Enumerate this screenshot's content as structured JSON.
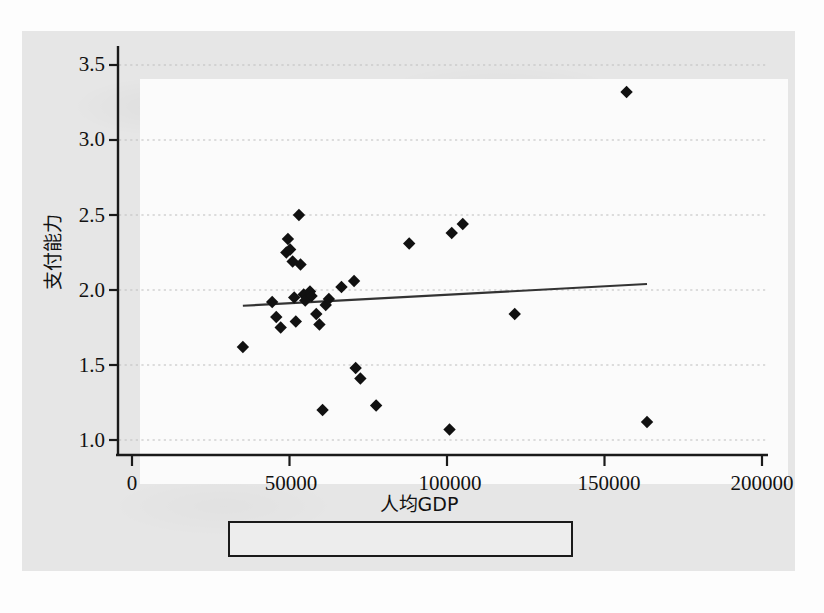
{
  "chart_data": {
    "type": "scatter",
    "title": "",
    "xlabel": "人均GDP",
    "ylabel": "支付能力",
    "xlim": [
      0,
      200000
    ],
    "ylim": [
      0.88,
      3.62
    ],
    "x_ticks": [
      0,
      50000,
      100000,
      150000,
      200000
    ],
    "x_tick_labels": [
      "0",
      "50000",
      "100000",
      "150000",
      "200000"
    ],
    "y_ticks": [
      1.0,
      1.5,
      2.0,
      2.5,
      3.0,
      3.5
    ],
    "y_tick_labels": [
      "1.0",
      "1.5",
      "2.0",
      "2.5",
      "3.0",
      "3.5"
    ],
    "grid": "horizontal-dotted",
    "legend_position": "bottom-center",
    "series": [
      {
        "name": "rate_m",
        "type": "scatter",
        "marker": "diamond",
        "color": "#111111",
        "points": [
          [
            35200,
            1.62
          ],
          [
            44500,
            1.92
          ],
          [
            45800,
            1.82
          ],
          [
            47200,
            1.75
          ],
          [
            49000,
            2.25
          ],
          [
            49500,
            2.34
          ],
          [
            50200,
            2.27
          ],
          [
            51000,
            2.19
          ],
          [
            51500,
            1.95
          ],
          [
            52000,
            1.79
          ],
          [
            53000,
            2.5
          ],
          [
            53500,
            2.17
          ],
          [
            54500,
            1.97
          ],
          [
            55000,
            1.93
          ],
          [
            56500,
            1.99
          ],
          [
            57000,
            1.96
          ],
          [
            58500,
            1.84
          ],
          [
            59500,
            1.77
          ],
          [
            60500,
            1.2
          ],
          [
            61500,
            1.9
          ],
          [
            62500,
            1.94
          ],
          [
            66500,
            2.02
          ],
          [
            70500,
            2.06
          ],
          [
            71000,
            1.48
          ],
          [
            72500,
            1.41
          ],
          [
            77500,
            1.23
          ],
          [
            88000,
            2.31
          ],
          [
            100800,
            1.07
          ],
          [
            101500,
            2.38
          ],
          [
            105000,
            2.44
          ],
          [
            121500,
            1.84
          ],
          [
            157000,
            3.32
          ],
          [
            163500,
            1.12
          ]
        ]
      },
      {
        "name": "Fitted values",
        "type": "line",
        "color": "#333333",
        "x_start": 35200,
        "x_end": 163500,
        "y_start": 1.895,
        "y_end": 2.04,
        "slope_per_unit": 1.13e-06,
        "intercept": 1.855
      }
    ]
  },
  "legend": {
    "entries": [
      {
        "label": "rate_m",
        "marker": "diamond"
      },
      {
        "label": "Fitted values",
        "marker": "line"
      }
    ]
  },
  "axes": {
    "y_label": "支付能力",
    "x_label": "人均GDP",
    "y_tick_0": "1.0",
    "y_tick_1": "1.5",
    "y_tick_2": "2.0",
    "y_tick_3": "2.5",
    "y_tick_4": "3.0",
    "y_tick_5": "3.5",
    "x_tick_0": "0",
    "x_tick_1": "50000",
    "x_tick_2": "100000",
    "x_tick_3": "150000",
    "x_tick_4": "200000"
  },
  "colors": {
    "panel_background": "#e6e6e6",
    "plot_background": "#fbfbfb",
    "marker": "#111111",
    "line": "#333333",
    "axis": "#1a1a1a",
    "grid": "#b9b9b9"
  }
}
